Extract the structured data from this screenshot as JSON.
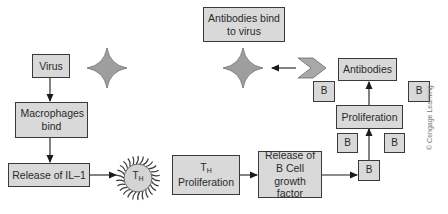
{
  "diagram": {
    "nodes": {
      "virus": "Virus",
      "macrophages": "Macrophages bind",
      "il1": "Release of IL–1",
      "th_cell": {
        "main": "T",
        "sub": "H"
      },
      "th_proliferation": {
        "main": "T",
        "sub": "H",
        "label": "Proliferation"
      },
      "b_growth": "Release of B Cell growth factor",
      "b_cell": "B",
      "proliferation": "Proliferation",
      "antibodies": "Antibodies",
      "antibodies_bind": "Antibodies bind to virus",
      "b_small": [
        "B",
        "B",
        "B",
        "B"
      ]
    },
    "colors": {
      "box_fill": "#d9d9d9",
      "box_border": "#3a3a3a",
      "shape_fill": "#9e9e9e",
      "arrow": "#1a1a1a"
    },
    "credit": "© Cengage Learning"
  }
}
